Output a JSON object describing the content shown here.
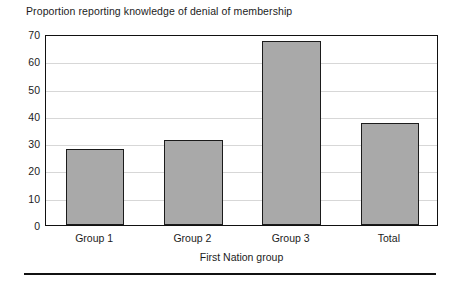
{
  "chart_data": {
    "type": "bar",
    "title": "Proportion reporting knowledge of denial of membership",
    "xlabel": "First Nation group",
    "ylabel": "",
    "categories": [
      "Group 1",
      "Group 2",
      "Group 3",
      "Total"
    ],
    "values": [
      28,
      31,
      67.5,
      37.5
    ],
    "ylim": [
      0,
      70
    ],
    "ytick_labels": [
      "0",
      "10",
      "20",
      "30",
      "40",
      "50",
      "60",
      "70"
    ],
    "ytick_values": [
      0,
      10,
      20,
      30,
      40,
      50,
      60,
      70
    ],
    "grid": true,
    "legend": "none",
    "bar_fill_color": "#a9a9a9",
    "bar_edge_color": "#1b1b1b",
    "gridline_color": "#d7d7d7",
    "axis_color": "#111111",
    "background_color": "#ffffff"
  }
}
